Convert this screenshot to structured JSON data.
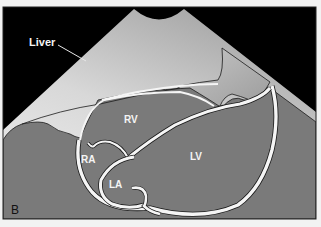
{
  "figure": {
    "panel_label": "B",
    "labels": {
      "liver": "Liver",
      "rv": "RV",
      "ra": "RA",
      "la": "LA",
      "lv": "LV"
    },
    "colors": {
      "background": "#f2f2f2",
      "sector_outside": "#000000",
      "tissue_gray": "#7a7a7a",
      "liver_light": "#e6e6e6",
      "liver_mid": "#b4b4b4",
      "wall_white": "#f5f5f5",
      "outline": "#1a1a1a",
      "label_text": "#f4f4f4"
    }
  }
}
